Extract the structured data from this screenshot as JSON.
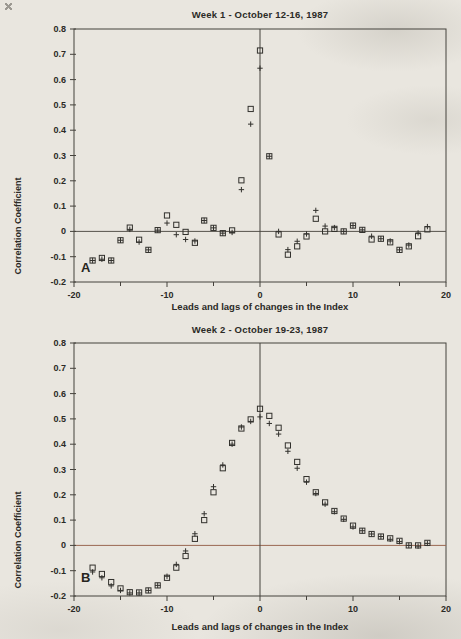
{
  "page": {
    "background": "#e9e6df",
    "ink": "#32312d",
    "frame_color": "#45423c"
  },
  "chart_data": [
    {
      "type": "scatter",
      "title": "Week 1 - October 12-16, 1987",
      "panel_label": "A",
      "xlabel": "Leads and lags of changes in the Index",
      "ylabel": "Correlation Coefficient",
      "xlim": [
        -20,
        20
      ],
      "ylim": [
        -0.2,
        0.8
      ],
      "x_major_ticks": [
        -20,
        -10,
        0,
        10,
        20
      ],
      "x_major_tick_labels": [
        "-20",
        "-10",
        "0",
        "10",
        "20"
      ],
      "x_minor_ticks": [
        -15,
        -5,
        5,
        15
      ],
      "y_ticks": [
        -0.2,
        -0.1,
        0,
        0.1,
        0.2,
        0.3,
        0.4,
        0.5,
        0.6,
        0.7,
        0.8
      ],
      "y_tick_labels": [
        "-0.2",
        "-0.1",
        "0",
        "0.1",
        "0.2",
        "0.3",
        "0.4",
        "0.5",
        "0.6",
        "0.7",
        "0.8"
      ],
      "grid": false,
      "legend": "none",
      "zero_line_color": "#55524b",
      "x": [
        -18,
        -17,
        -16,
        -15,
        -14,
        -13,
        -12,
        -11,
        -10,
        -9,
        -8,
        -7,
        -6,
        -5,
        -4,
        -3,
        -2,
        -1,
        0,
        1,
        2,
        3,
        4,
        5,
        6,
        7,
        8,
        9,
        10,
        11,
        12,
        13,
        14,
        15,
        16,
        17,
        18
      ],
      "series": [
        {
          "name": "square",
          "marker": "square",
          "values": [
            -0.115,
            -0.105,
            -0.115,
            -0.035,
            0.015,
            -0.033,
            -0.073,
            0.005,
            0.063,
            0.026,
            -0.002,
            -0.045,
            0.043,
            0.014,
            -0.007,
            0.004,
            0.202,
            0.484,
            0.715,
            0.297,
            -0.012,
            -0.092,
            -0.059,
            -0.02,
            0.05,
            0.0,
            0.01,
            0.0,
            0.023,
            0.006,
            -0.032,
            -0.029,
            -0.043,
            -0.073,
            -0.059,
            -0.019,
            0.008
          ]
        },
        {
          "name": "plus",
          "marker": "plus",
          "values": [
            -0.115,
            -0.11,
            -0.115,
            -0.035,
            0.008,
            -0.042,
            -0.073,
            0.005,
            0.033,
            -0.013,
            -0.032,
            -0.038,
            0.043,
            0.014,
            -0.007,
            -0.004,
            0.165,
            0.424,
            0.645,
            0.297,
            0.0,
            -0.072,
            -0.039,
            -0.01,
            0.083,
            0.021,
            0.015,
            0.0,
            0.023,
            0.006,
            -0.019,
            -0.029,
            -0.038,
            -0.073,
            -0.054,
            -0.006,
            0.019
          ]
        }
      ]
    },
    {
      "type": "scatter",
      "title": "Week 2 - October 19-23, 1987",
      "panel_label": "B",
      "xlabel": "Leads and lags of changes in the Index",
      "ylabel": "Correlation Coefficient",
      "xlim": [
        -20,
        20
      ],
      "ylim": [
        -0.2,
        0.8
      ],
      "x_major_ticks": [
        -20,
        -10,
        0,
        10,
        20
      ],
      "x_major_tick_labels": [
        "-20",
        "-10",
        "0",
        "10",
        "20"
      ],
      "x_minor_ticks": [
        -15,
        -5,
        5,
        15
      ],
      "y_ticks": [
        -0.2,
        -0.1,
        0,
        0.1,
        0.2,
        0.3,
        0.4,
        0.5,
        0.6,
        0.7,
        0.8
      ],
      "y_tick_labels": [
        "-0.2",
        "-0.1",
        "0",
        "0.1",
        "0.2",
        "0.3",
        "0.4",
        "0.5",
        "0.6",
        "0.7",
        "0.8"
      ],
      "grid": false,
      "legend": "none",
      "zero_line_color": "#9a6752",
      "x": [
        -18,
        -17,
        -16,
        -15,
        -14,
        -13,
        -12,
        -11,
        -10,
        -9,
        -8,
        -7,
        -6,
        -5,
        -4,
        -3,
        -2,
        -1,
        0,
        1,
        2,
        3,
        4,
        5,
        6,
        7,
        8,
        9,
        10,
        11,
        12,
        13,
        14,
        15,
        16,
        17,
        18
      ],
      "series": [
        {
          "name": "square",
          "marker": "square",
          "values": [
            -0.088,
            -0.113,
            -0.145,
            -0.17,
            -0.185,
            -0.186,
            -0.178,
            -0.158,
            -0.128,
            -0.088,
            -0.042,
            0.026,
            0.1,
            0.21,
            0.305,
            0.405,
            0.462,
            0.498,
            0.54,
            0.512,
            0.465,
            0.395,
            0.33,
            0.262,
            0.21,
            0.17,
            0.136,
            0.106,
            0.078,
            0.058,
            0.045,
            0.035,
            0.028,
            0.018,
            0.0,
            0.0,
            0.01
          ]
        },
        {
          "name": "plus",
          "marker": "plus",
          "values": [
            -0.105,
            -0.128,
            -0.16,
            -0.178,
            -0.188,
            -0.188,
            -0.178,
            -0.158,
            -0.122,
            -0.075,
            -0.022,
            0.046,
            0.125,
            0.232,
            0.318,
            0.4,
            0.468,
            0.49,
            0.508,
            0.482,
            0.44,
            0.372,
            0.305,
            0.25,
            0.205,
            0.163,
            0.133,
            0.103,
            0.073,
            0.058,
            0.045,
            0.035,
            0.024,
            0.015,
            0.0,
            -0.003,
            0.008
          ]
        }
      ]
    }
  ]
}
